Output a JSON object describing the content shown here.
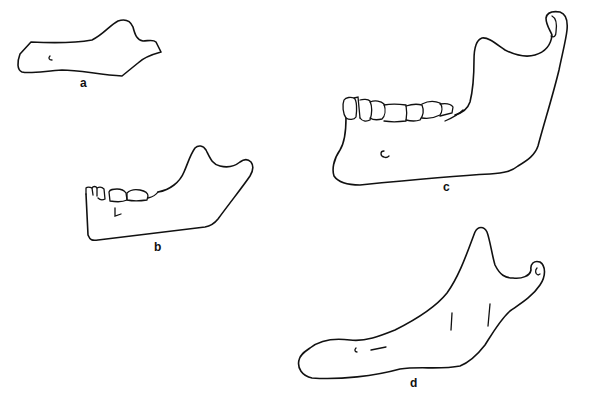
{
  "figure": {
    "header_fragment": "",
    "panels": [
      {
        "id": "a",
        "label": "a",
        "subject": "mandible outline without teeth"
      },
      {
        "id": "b",
        "label": "b",
        "subject": "mandible with teeth"
      },
      {
        "id": "c",
        "label": "c",
        "subject": "mandible with teeth, large"
      },
      {
        "id": "d",
        "label": "d",
        "subject": "edentulous mandible"
      }
    ]
  }
}
